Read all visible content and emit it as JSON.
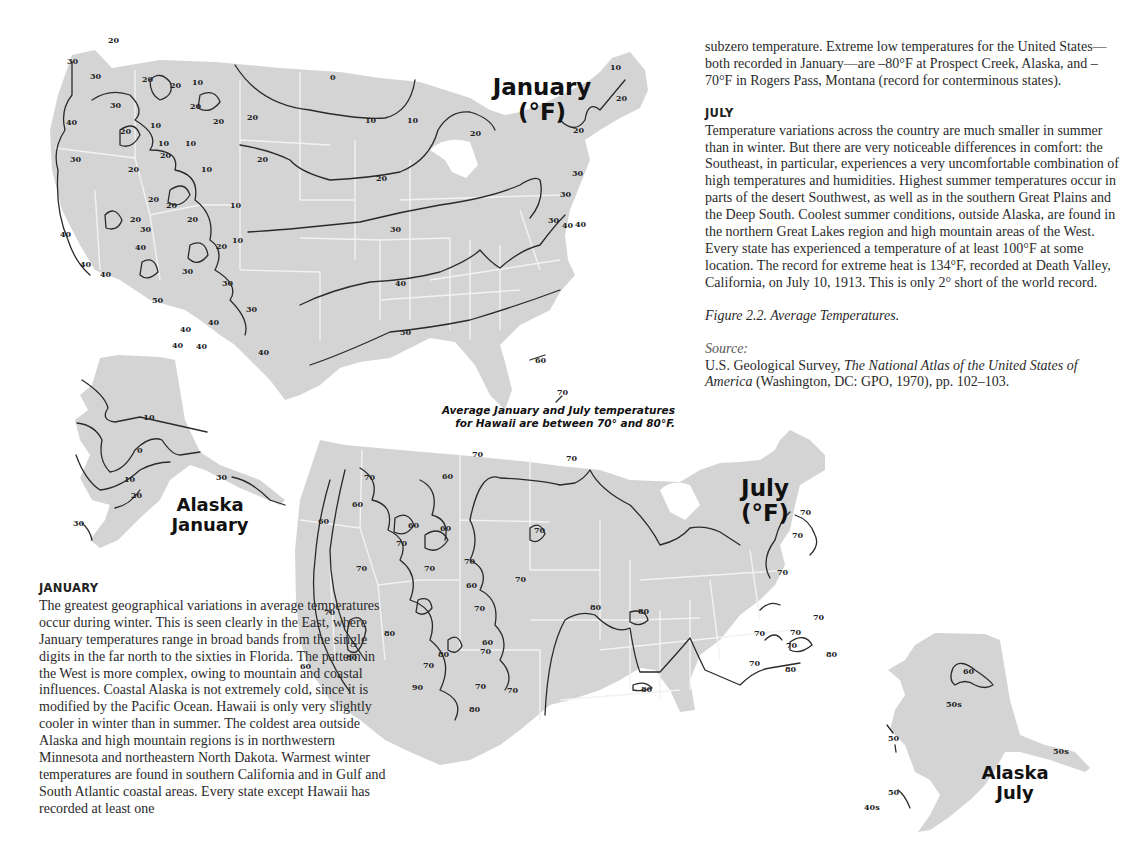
{
  "page": {
    "type": "book page with isotherm maps"
  },
  "maps": {
    "january": {
      "title_line1": "January",
      "title_line2": "(°F)",
      "isotherm_values": [
        "0",
        "10",
        "20",
        "30",
        "40",
        "50",
        "60",
        "70"
      ],
      "labels": {
        "west": [
          "20",
          "30",
          "30",
          "40",
          "30",
          "20",
          "20",
          "10",
          "20",
          "10",
          "20",
          "10",
          "10",
          "20",
          "20",
          "30",
          "20",
          "10",
          "20",
          "20",
          "20",
          "20",
          "40",
          "40",
          "40",
          "30",
          "40",
          "20",
          "30",
          "10",
          "30",
          "50",
          "40",
          "40",
          "40",
          "40",
          "30",
          "30"
        ],
        "east": [
          "0",
          "10",
          "10",
          "20",
          "20",
          "30",
          "30",
          "40",
          "40",
          "50",
          "60",
          "70",
          "20",
          "10",
          "20",
          "30",
          "30",
          "40",
          "40"
        ]
      }
    },
    "alaska_january": {
      "title_line1": "Alaska",
      "title_line2": "January",
      "labels": [
        "-10",
        "0",
        "10",
        "20",
        "30",
        "30"
      ]
    },
    "hawaii_note": {
      "line1": "Average January and July temperatures",
      "line2": "for Hawaii are between 70° and 80°F."
    },
    "july": {
      "title_line1": "July",
      "title_line2": "(°F)",
      "isotherm_values": [
        "60",
        "70",
        "80",
        "90"
      ],
      "labels": {
        "west": [
          "70",
          "70",
          "60",
          "60",
          "60",
          "60",
          "60",
          "70",
          "70",
          "70",
          "60",
          "70",
          "70",
          "70",
          "70",
          "70",
          "60",
          "80",
          "80",
          "80",
          "70",
          "60",
          "70",
          "90",
          "70",
          "70",
          "80",
          "60"
        ],
        "east": [
          "70",
          "80",
          "80",
          "80",
          "70",
          "70",
          "70",
          "70",
          "70",
          "70",
          "70",
          "80",
          "80"
        ]
      }
    },
    "alaska_july": {
      "title_line1": "Alaska",
      "title_line2": "July",
      "labels": [
        "60",
        "50s",
        "50",
        "50",
        "40s",
        "50s"
      ]
    }
  },
  "text": {
    "continued_paragraph": "subzero temperature. Extreme low temperatures for the United States—both recorded in January—are –80°F at Prospect Creek, Alaska, and –70°F in Rogers Pass, Montana (record for conterminous states).",
    "july_heading": "JULY",
    "july_paragraph": "Temperature variations across the country are much smaller in summer than in winter. But there are very noticeable differences in comfort: the Southeast, in particular, experiences a very uncomfortable combination of high temperatures and humidities. Highest summer temperatures occur in parts of the desert Southwest, as well as in the southern Great Plains and the Deep South. Coolest summer conditions, outside Alaska, are found in the northern Great Lakes region and high mountain areas of the West. Every state has experienced a temperature of at least 100°F at some location. The record for extreme heat is 134°F, recorded at Death Valley, California, on July 10, 1913. This is only 2° short of the world record.",
    "figure_caption": "Figure 2.2.  Average Temperatures.",
    "source_label": "Source:",
    "source_author": "U.S. Geological Survey, ",
    "source_title": "The National Atlas of the United States of America",
    "source_rest": " (Washington, DC: GPO, 1970), pp. 102–103.",
    "january_heading": "JANUARY",
    "january_paragraph": "The greatest geographical variations in average temperatures occur during winter. This is seen clearly in the East, where January temperatures range in broad bands from the single digits in the far north to the sixties in Florida. The pattern in the West is more complex, owing to mountain and coastal influences. Coastal Alaska is not extremely cold, since it is modified by the Pacific Ocean. Hawaii is only very slightly cooler in winter than in summer. The coldest area outside Alaska and high mountain regions is in northwestern Minnesota and northeastern North Dakota. Warmest winter temperatures are found in southern California and in Gulf and South Atlantic coastal areas. Every state except Hawaii has recorded at least one"
  },
  "colors": {
    "land": "#d4d4d4",
    "state_border": "#f2f2f2",
    "isotherm": "#2a2a2a",
    "text": "#2a2a2a"
  }
}
